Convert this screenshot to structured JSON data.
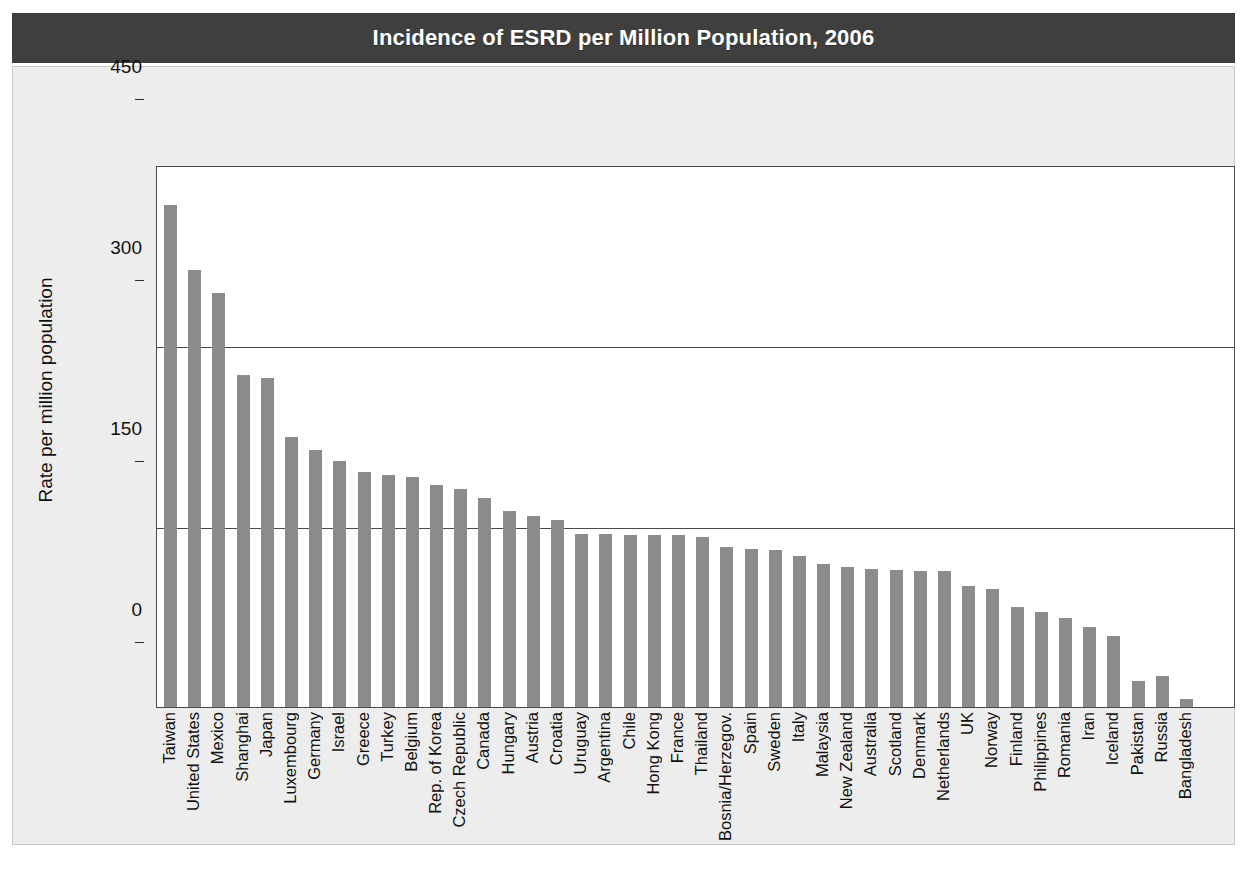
{
  "figure": {
    "title": "Incidence of ESRD per Million Population, 2006",
    "title_band_color": "#3f3f3f",
    "panel_color": "#ededed",
    "bar_color": "#8c8c8c",
    "axis_color": "#4a4a4a"
  },
  "chart_data": {
    "type": "bar",
    "title": "Incidence of ESRD per Million Population, 2006",
    "xlabel": "",
    "ylabel": "Rate per million population",
    "ylim": [
      0,
      450
    ],
    "yticks": [
      0,
      150,
      300,
      450
    ],
    "ytick_labels": [
      "0",
      "150",
      "300",
      "450"
    ],
    "grid": true,
    "legend": null,
    "categories": [
      "Taiwan",
      "United States",
      "Mexico",
      "Shanghai",
      "Japan",
      "Luxembourg",
      "Germany",
      "Israel",
      "Greece",
      "Turkey",
      "Belgium",
      "Rep. of Korea",
      "Czech Republic",
      "Canada",
      "Hungary",
      "Austria",
      "Croatia",
      "Uruguay",
      "Argentina",
      "Chile",
      "Hong Kong",
      "France",
      "Thailand",
      "Bosnia/Herzegov.",
      "Spain",
      "Sweden",
      "Italy",
      "Malaysia",
      "New Zealand",
      "Australia",
      "Scotland",
      "Denmark",
      "Netherlands",
      "UK",
      "Norway",
      "Finland",
      "Philippines",
      "Romania",
      "Iran",
      "Iceland",
      "Pakistan",
      "Russia",
      "Bangladesh"
    ],
    "values": [
      418,
      364,
      345,
      277,
      274,
      225,
      214,
      205,
      196,
      193,
      192,
      185,
      182,
      174,
      163,
      159,
      156,
      144,
      144,
      143,
      143,
      143,
      142,
      133,
      132,
      131,
      126,
      119,
      117,
      115,
      114,
      113,
      113,
      101,
      98,
      83,
      79,
      74,
      67,
      59,
      22,
      26,
      7
    ]
  }
}
